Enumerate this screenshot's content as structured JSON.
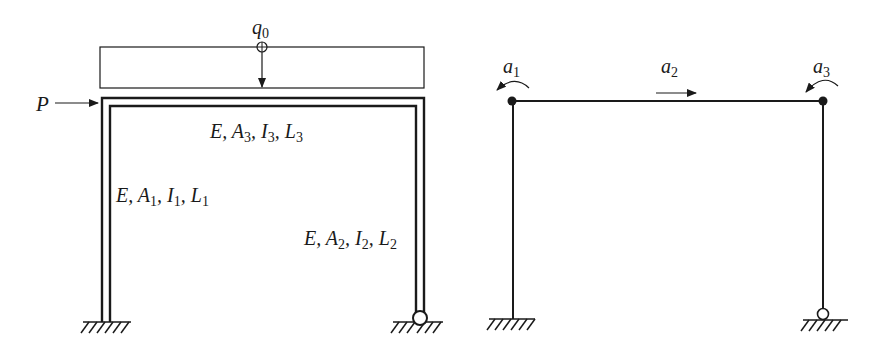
{
  "left_figure": {
    "load_label": "q",
    "load_label_sub": "0",
    "force_label": "P",
    "beam_props": {
      "E": "E,",
      "A": "A",
      "A_sub": "3",
      "I": "I",
      "I_sub": "3",
      "L": "L",
      "L_sub": "3"
    },
    "left_col_props": {
      "E": "E,",
      "A": "A",
      "A_sub": "1",
      "I": "I",
      "I_sub": "1",
      "L": "L",
      "L_sub": "1"
    },
    "right_col_props": {
      "E": "E,",
      "A": "A",
      "A_sub": "2",
      "I": "I",
      "I_sub": "2",
      "L": "L",
      "L_sub": "2"
    },
    "supports": {
      "left": "fixed",
      "right": "pinned"
    }
  },
  "right_figure": {
    "dof_labels": [
      {
        "name": "a",
        "sub": "1",
        "type": "rotation"
      },
      {
        "name": "a",
        "sub": "2",
        "type": "translation"
      },
      {
        "name": "a",
        "sub": "3",
        "type": "rotation"
      }
    ],
    "supports": {
      "left": "fixed",
      "right": "pinned"
    }
  },
  "colors": {
    "stroke": "#1a1a1a",
    "background": "#ffffff"
  }
}
